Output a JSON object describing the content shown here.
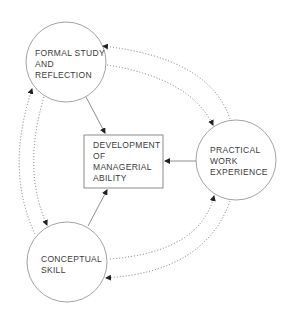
{
  "diagram": {
    "nodes": {
      "formal_study": {
        "lines": [
          "FORMAL STUDY",
          "AND",
          "REFLECTION"
        ],
        "shape": "circle"
      },
      "practical_work": {
        "lines": [
          "PRACTICAL",
          "WORK",
          "EXPERIENCE"
        ],
        "shape": "circle"
      },
      "conceptual_skill": {
        "lines": [
          "CONCEPTUAL",
          "SKILL"
        ],
        "shape": "circle"
      },
      "development": {
        "lines": [
          "DEVELOPMENT",
          "OF",
          "MANAGERIAL",
          "ABILITY"
        ],
        "shape": "box"
      }
    },
    "edges": [
      {
        "from": "formal_study",
        "to": "development",
        "style": "solid"
      },
      {
        "from": "practical_work",
        "to": "development",
        "style": "solid"
      },
      {
        "from": "conceptual_skill",
        "to": "development",
        "style": "solid"
      },
      {
        "from": "practical_work",
        "to": "formal_study",
        "style": "dotted"
      },
      {
        "from": "formal_study",
        "to": "practical_work",
        "style": "dotted"
      },
      {
        "from": "conceptual_skill",
        "to": "formal_study",
        "style": "dotted"
      },
      {
        "from": "formal_study",
        "to": "conceptual_skill",
        "style": "dotted"
      },
      {
        "from": "practical_work",
        "to": "conceptual_skill",
        "style": "dotted"
      },
      {
        "from": "conceptual_skill",
        "to": "practical_work",
        "style": "dotted"
      }
    ],
    "colors": {
      "line": "#6e6e6e",
      "text": "#3a3a3a",
      "background": "#ffffff"
    }
  }
}
